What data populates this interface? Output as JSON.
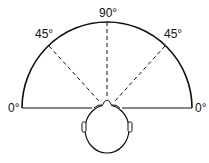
{
  "diagram": {
    "title": "",
    "type": "angle-of-view-semicircle",
    "labels": {
      "left_0": "0°",
      "left_45": "45°",
      "top_90": "90°",
      "right_45": "45°",
      "right_0": "0°"
    },
    "angles_degrees": [
      0,
      45,
      90,
      45,
      0
    ],
    "elements": [
      "semicircle-arc",
      "baseline",
      "dashed-line-45-left",
      "dashed-line-90",
      "dashed-line-45-right",
      "head-top-view"
    ],
    "stroke_color": "#111111"
  }
}
